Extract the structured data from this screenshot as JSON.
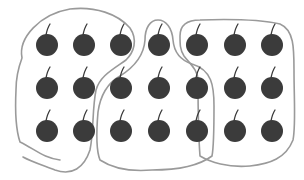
{
  "diagram": {
    "item_type": "cherry",
    "rows": 3,
    "columns": 7,
    "total_items": 21,
    "colors": {
      "cherry": "#3b3b3b",
      "loop": "#9a9a9a",
      "background": "#ffffff"
    },
    "groups": [
      {
        "name": "left-group",
        "count": 7,
        "members": [
          [
            0,
            0
          ],
          [
            0,
            1
          ],
          [
            0,
            2
          ],
          [
            1,
            0
          ],
          [
            1,
            1
          ],
          [
            2,
            0
          ],
          [
            2,
            1
          ]
        ]
      },
      {
        "name": "middle-group",
        "count": 7,
        "members": [
          [
            0,
            3
          ],
          [
            1,
            2
          ],
          [
            1,
            3
          ],
          [
            1,
            4
          ],
          [
            2,
            2
          ],
          [
            2,
            3
          ],
          [
            2,
            4
          ]
        ]
      },
      {
        "name": "right-group",
        "count": 7,
        "members": [
          [
            0,
            4
          ],
          [
            0,
            5
          ],
          [
            0,
            6
          ],
          [
            1,
            5
          ],
          [
            1,
            6
          ],
          [
            2,
            5
          ],
          [
            2,
            6
          ]
        ]
      }
    ]
  }
}
